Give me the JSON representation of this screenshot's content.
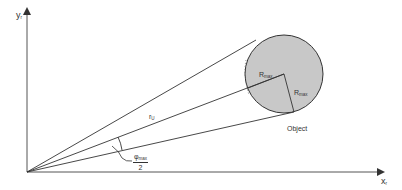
{
  "diagram": {
    "type": "geometry-schematic",
    "colors": {
      "line": "#333333",
      "axis": "#555555",
      "object_fill": "#c8c8c8",
      "object_stroke": "#333333",
      "background": "#ffffff"
    },
    "axes": {
      "y": {
        "label": "y",
        "subscript": "r"
      },
      "x": {
        "label": "x",
        "subscript": "r"
      }
    },
    "object": {
      "label": "Object",
      "radius_labels": [
        {
          "label": "R",
          "subscript": "max"
        },
        {
          "label": "R",
          "subscript": "max"
        }
      ]
    },
    "distance": {
      "label": "r",
      "subscript": "U"
    },
    "angle": {
      "numerator": "φ",
      "numerator_subscript": "max",
      "denominator": "2"
    }
  }
}
